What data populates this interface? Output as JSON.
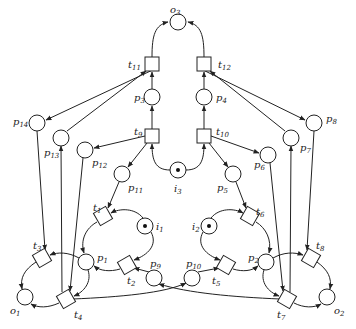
{
  "diagram": {
    "type": "petri-net",
    "places": [
      {
        "id": "o3",
        "label": "o",
        "sub": "3",
        "x": 178,
        "y": 22,
        "tokens": 0,
        "lx": 170,
        "ly": 13
      },
      {
        "id": "p3",
        "label": "p",
        "sub": "3",
        "x": 152,
        "y": 97,
        "tokens": 0,
        "lx": 132,
        "ly": 100
      },
      {
        "id": "p4",
        "label": "p",
        "sub": "4",
        "x": 204,
        "y": 97,
        "tokens": 0,
        "lx": 216,
        "ly": 100
      },
      {
        "id": "i3",
        "label": "i",
        "sub": "3",
        "x": 178,
        "y": 170,
        "tokens": 1,
        "lx": 174,
        "ly": 191
      },
      {
        "id": "p11",
        "label": "p",
        "sub": "11",
        "x": 122,
        "y": 174,
        "tokens": 0,
        "lx": 128,
        "ly": 190
      },
      {
        "id": "p5",
        "label": "p",
        "sub": "5",
        "x": 233,
        "y": 174,
        "tokens": 0,
        "lx": 216,
        "ly": 190
      },
      {
        "id": "p12",
        "label": "p",
        "sub": "12",
        "x": 85,
        "y": 150,
        "tokens": 0,
        "lx": 92,
        "ly": 165
      },
      {
        "id": "p6",
        "label": "p",
        "sub": "6",
        "x": 268,
        "y": 155,
        "tokens": 0,
        "lx": 254,
        "ly": 167
      },
      {
        "id": "p14",
        "label": "p",
        "sub": "14",
        "x": 37,
        "y": 123,
        "tokens": 0,
        "lx": 14,
        "ly": 124
      },
      {
        "id": "p13",
        "label": "p",
        "sub": "13",
        "x": 61,
        "y": 138,
        "tokens": 0,
        "lx": 44,
        "ly": 155
      },
      {
        "id": "p7",
        "label": "p",
        "sub": "7",
        "x": 291,
        "y": 138,
        "tokens": 0,
        "lx": 300,
        "ly": 150
      },
      {
        "id": "p8",
        "label": "p",
        "sub": "8",
        "x": 314,
        "y": 123,
        "tokens": 0,
        "lx": 327,
        "ly": 121
      },
      {
        "id": "i1",
        "label": "i",
        "sub": "1",
        "x": 145,
        "y": 226,
        "tokens": 1,
        "lx": 156,
        "ly": 229
      },
      {
        "id": "i2",
        "label": "i",
        "sub": "2",
        "x": 209,
        "y": 226,
        "tokens": 1,
        "lx": 192,
        "ly": 229
      },
      {
        "id": "p1",
        "label": "p",
        "sub": "1",
        "x": 86,
        "y": 262,
        "tokens": 0,
        "lx": 96,
        "ly": 260
      },
      {
        "id": "p2",
        "label": "p",
        "sub": "2",
        "x": 266,
        "y": 262,
        "tokens": 0,
        "lx": 248,
        "ly": 260
      },
      {
        "id": "p9",
        "label": "p",
        "sub": "9",
        "x": 154,
        "y": 278,
        "tokens": 0,
        "lx": 150,
        "ly": 266
      },
      {
        "id": "p10",
        "label": "p",
        "sub": "10",
        "x": 192,
        "y": 278,
        "tokens": 0,
        "lx": 186,
        "ly": 266
      },
      {
        "id": "o1",
        "label": "o",
        "sub": "1",
        "x": 25,
        "y": 297,
        "tokens": 0,
        "lx": 10,
        "ly": 313
      },
      {
        "id": "o2",
        "label": "o",
        "sub": "2",
        "x": 327,
        "y": 297,
        "tokens": 0,
        "lx": 334,
        "ly": 313
      }
    ],
    "transitions": [
      {
        "id": "t11",
        "label": "t",
        "sub": "11",
        "x": 152,
        "y": 64,
        "rot": 0,
        "lx": 128,
        "ly": 67
      },
      {
        "id": "t12",
        "label": "t",
        "sub": "12",
        "x": 204,
        "y": 64,
        "rot": 0,
        "lx": 218,
        "ly": 67
      },
      {
        "id": "t9",
        "label": "t",
        "sub": "9",
        "x": 152,
        "y": 136,
        "rot": 0,
        "lx": 134,
        "ly": 134
      },
      {
        "id": "t10",
        "label": "t",
        "sub": "10",
        "x": 204,
        "y": 136,
        "rot": 0,
        "lx": 216,
        "ly": 134
      },
      {
        "id": "t1",
        "label": "t",
        "sub": "1",
        "x": 103,
        "y": 216,
        "rot": -30,
        "lx": 94,
        "ly": 210
      },
      {
        "id": "t6",
        "label": "t",
        "sub": "6",
        "x": 250,
        "y": 216,
        "rot": 30,
        "lx": 256,
        "ly": 214
      },
      {
        "id": "t2",
        "label": "t",
        "sub": "2",
        "x": 127,
        "y": 265,
        "rot": -30,
        "lx": 127,
        "ly": 283
      },
      {
        "id": "t5",
        "label": "t",
        "sub": "5",
        "x": 226,
        "y": 265,
        "rot": 30,
        "lx": 212,
        "ly": 283
      },
      {
        "id": "t3",
        "label": "t",
        "sub": "3",
        "x": 42,
        "y": 258,
        "rot": -30,
        "lx": 33,
        "ly": 248
      },
      {
        "id": "t8",
        "label": "t",
        "sub": "8",
        "x": 311,
        "y": 258,
        "rot": 30,
        "lx": 316,
        "ly": 248
      },
      {
        "id": "t4",
        "label": "t",
        "sub": "4",
        "x": 66,
        "y": 299,
        "rot": -30,
        "lx": 74,
        "ly": 317
      },
      {
        "id": "t7",
        "label": "t",
        "sub": "7",
        "x": 287,
        "y": 299,
        "rot": 30,
        "lx": 277,
        "ly": 317
      }
    ]
  }
}
